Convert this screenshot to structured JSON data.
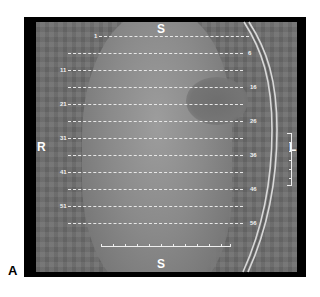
{
  "panel_label": "A",
  "orientation": {
    "top": "S",
    "bottom": "S",
    "left": "R",
    "right": "L"
  },
  "slices": {
    "left_labels": [
      "1",
      "11",
      "21",
      "31",
      "41",
      "51"
    ],
    "right_labels": [
      "6",
      "16",
      "26",
      "36",
      "46",
      "56"
    ],
    "count_lines": 12
  },
  "colors": {
    "frame": "#000000",
    "scan_background": "#6f6f6f",
    "slice_lines": "#e8e8e8",
    "label_text": "#ffffff"
  }
}
